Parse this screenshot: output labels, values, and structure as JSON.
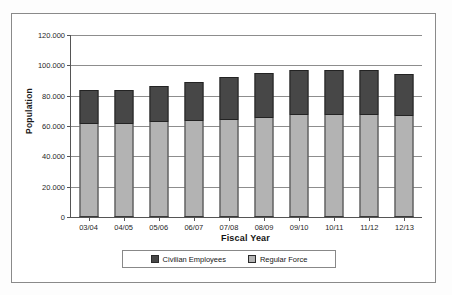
{
  "figure": {
    "background_color": "#fdfdfd",
    "border_color": "#8a8a8a"
  },
  "chart_data": {
    "type": "bar",
    "stacked": true,
    "title": "",
    "xlabel": "Fiscal Year",
    "ylabel": "Population",
    "categories": [
      "03/04",
      "04/05",
      "05/06",
      "06/07",
      "07/08",
      "08/09",
      "09/10",
      "10/11",
      "11/12",
      "12/13"
    ],
    "series": [
      {
        "name": "Regular Force",
        "color": "#b3b3b3",
        "values": [
          61500,
          61500,
          62500,
          63500,
          64000,
          65500,
          67500,
          67500,
          67000,
          66500
        ]
      },
      {
        "name": "Civilian Employees",
        "color": "#474747",
        "values": [
          22500,
          22500,
          24000,
          25500,
          28000,
          29500,
          29500,
          29500,
          30000,
          28000
        ]
      }
    ],
    "totals": [
      84000,
      84000,
      86500,
      89000,
      92000,
      95000,
      97000,
      97000,
      97000,
      94500
    ],
    "ylim": [
      0,
      120000
    ],
    "ytick_values": [
      0,
      20000,
      40000,
      60000,
      80000,
      100000,
      120000
    ],
    "ytick_labels": [
      "0",
      "20.000",
      "40.000",
      "60.000",
      "80.000",
      "100.000",
      "120.000"
    ],
    "grid": true,
    "legend_position": "bottom",
    "legend_entries": [
      "Civilian Employees",
      "Regular Force"
    ]
  },
  "axes": {
    "y_title": "Population",
    "x_title": "Fiscal Year"
  },
  "legend": {
    "items": [
      {
        "label": "Civilian Employees",
        "color": "#474747"
      },
      {
        "label": "Regular Force",
        "color": "#b3b3b3"
      }
    ]
  }
}
